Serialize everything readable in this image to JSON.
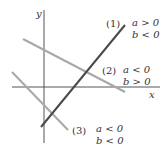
{
  "axes": {
    "x_label": "x",
    "y_label": "y"
  },
  "lines": [
    {
      "id": "1",
      "tag": "(1)",
      "cond_a": "a > 0",
      "cond_b": "b < 0",
      "color": "#4a4a4a"
    },
    {
      "id": "2",
      "tag": "(2)",
      "cond_a": "a < 0",
      "cond_b": "b > 0",
      "color": "#a8a8a8"
    },
    {
      "id": "3",
      "tag": "(3)",
      "cond_a": "a < 0",
      "cond_b": "b < 0",
      "color": "#a8a8a8"
    }
  ]
}
